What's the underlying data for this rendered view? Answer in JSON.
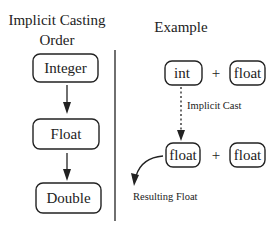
{
  "left_panel": {
    "title_line1": "Implicit Casting",
    "title_line2": "Order",
    "nodes": [
      {
        "label": "Integer"
      },
      {
        "label": "Float"
      },
      {
        "label": "Double"
      }
    ]
  },
  "right_panel": {
    "title": "Example",
    "row1": {
      "left": "int",
      "operator": "+",
      "right": "float"
    },
    "cast_label": "Implicit Cast",
    "row2": {
      "left": "float",
      "operator": "+",
      "right": "float"
    },
    "result_label": "Resulting Float"
  }
}
